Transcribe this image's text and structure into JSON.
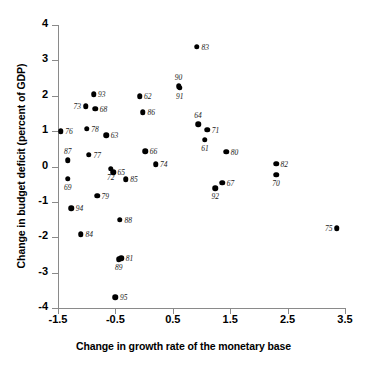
{
  "chart_data": {
    "type": "scatter",
    "title": "",
    "xlabel": "Change in growth rate of the monetary base",
    "ylabel": "Change in budget deficit (percent of GDP)",
    "xlim": [
      -1.5,
      3.5
    ],
    "ylim": [
      -4,
      4
    ],
    "xticks": [
      "-1.5",
      "-0.5",
      "0.5",
      "1.5",
      "2.5",
      "3.5"
    ],
    "xtick_values": [
      -1.5,
      -0.5,
      0.5,
      1.5,
      2.5,
      3.5
    ],
    "yticks": [
      "4",
      "3",
      "2",
      "1",
      "0",
      "-1",
      "-2",
      "-3",
      "-4"
    ],
    "ytick_values": [
      4,
      3,
      2,
      1,
      0,
      -1,
      -2,
      -3,
      -4
    ],
    "grid": false,
    "legend": "none",
    "point_color": "#000000",
    "axis_color": "#8a8a8a",
    "points": [
      {
        "label": "76",
        "x": -1.45,
        "y": 1.0,
        "lpos": "r"
      },
      {
        "label": "87",
        "x": -1.33,
        "y": 0.17,
        "lpos": "t"
      },
      {
        "label": "69",
        "x": -1.33,
        "y": -0.34,
        "lpos": "b"
      },
      {
        "label": "94",
        "x": -1.27,
        "y": -1.18,
        "lpos": "r"
      },
      {
        "label": "84",
        "x": -1.1,
        "y": -1.92,
        "lpos": "r"
      },
      {
        "label": "73",
        "x": -1.02,
        "y": 1.7,
        "lpos": "l"
      },
      {
        "label": "78",
        "x": -1.0,
        "y": 1.07,
        "lpos": "r"
      },
      {
        "label": "77",
        "x": -0.96,
        "y": 0.33,
        "lpos": "r"
      },
      {
        "label": "93",
        "x": -0.88,
        "y": 2.04,
        "lpos": "r"
      },
      {
        "label": "68",
        "x": -0.85,
        "y": 1.63,
        "lpos": "r"
      },
      {
        "label": "79",
        "x": -0.82,
        "y": -0.83,
        "lpos": "r"
      },
      {
        "label": "63",
        "x": -0.66,
        "y": 0.88,
        "lpos": "r"
      },
      {
        "label": "72",
        "x": -0.58,
        "y": -0.07,
        "lpos": "b"
      },
      {
        "label": "65",
        "x": -0.54,
        "y": -0.16,
        "lpos": "r"
      },
      {
        "label": "95",
        "x": -0.5,
        "y": -3.7,
        "lpos": "r"
      },
      {
        "label": "89",
        "x": -0.44,
        "y": -2.62,
        "lpos": "b"
      },
      {
        "label": "88",
        "x": -0.42,
        "y": -1.5,
        "lpos": "r"
      },
      {
        "label": "81",
        "x": -0.4,
        "y": -2.6,
        "lpos": "r"
      },
      {
        "label": "85",
        "x": -0.32,
        "y": -0.36,
        "lpos": "r"
      },
      {
        "label": "62",
        "x": -0.08,
        "y": 1.99,
        "lpos": "r"
      },
      {
        "label": "86",
        "x": -0.02,
        "y": 1.54,
        "lpos": "r"
      },
      {
        "label": "66",
        "x": 0.02,
        "y": 0.43,
        "lpos": "r"
      },
      {
        "label": "74",
        "x": 0.2,
        "y": 0.06,
        "lpos": "r"
      },
      {
        "label": "90",
        "x": 0.6,
        "y": 2.27,
        "lpos": "t"
      },
      {
        "label": "91",
        "x": 0.62,
        "y": 2.23,
        "lpos": "b"
      },
      {
        "label": "83",
        "x": 0.92,
        "y": 3.38,
        "lpos": "r"
      },
      {
        "label": "64",
        "x": 0.94,
        "y": 1.19,
        "lpos": "t"
      },
      {
        "label": "71",
        "x": 1.1,
        "y": 1.04,
        "lpos": "r"
      },
      {
        "label": "61",
        "x": 1.06,
        "y": 0.75,
        "lpos": "b"
      },
      {
        "label": "92",
        "x": 1.24,
        "y": -0.61,
        "lpos": "b"
      },
      {
        "label": "67",
        "x": 1.36,
        "y": -0.46,
        "lpos": "r"
      },
      {
        "label": "80",
        "x": 1.43,
        "y": 0.41,
        "lpos": "r"
      },
      {
        "label": "82",
        "x": 2.3,
        "y": 0.08,
        "lpos": "r"
      },
      {
        "label": "70",
        "x": 2.3,
        "y": -0.23,
        "lpos": "b"
      },
      {
        "label": "75",
        "x": 3.36,
        "y": -1.74,
        "lpos": "l"
      }
    ]
  }
}
